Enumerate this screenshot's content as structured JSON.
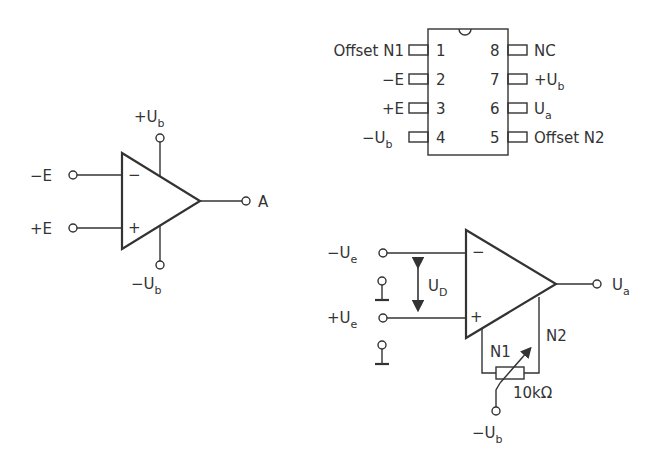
{
  "symbol": {
    "inverting_input": "−E",
    "noninverting_input": "+E",
    "output": "A",
    "supply_pos": "+U",
    "supply_pos_sub": "b",
    "supply_neg": "−U",
    "supply_neg_sub": "b",
    "minus_sign": "−",
    "plus_sign": "+"
  },
  "pinout": {
    "left_pins": [
      {
        "num": "1",
        "label": "Offset N1",
        "sub": ""
      },
      {
        "num": "2",
        "label": "−E",
        "sub": ""
      },
      {
        "num": "3",
        "label": "+E",
        "sub": ""
      },
      {
        "num": "4",
        "label": "−U",
        "sub": "b"
      }
    ],
    "right_pins": [
      {
        "num": "8",
        "label": "NC",
        "sub": ""
      },
      {
        "num": "7",
        "label": "+U",
        "sub": "b"
      },
      {
        "num": "6",
        "label": "U",
        "sub": "a"
      },
      {
        "num": "5",
        "label": "Offset N2",
        "sub": ""
      }
    ]
  },
  "offset_circuit": {
    "inv_input": "−U",
    "inv_input_sub": "e",
    "noninv_input": "+U",
    "noninv_input_sub": "e",
    "diff_voltage": "U",
    "diff_voltage_sub": "D",
    "output": "U",
    "output_sub": "a",
    "n1": "N1",
    "n2": "N2",
    "pot_value": "10kΩ",
    "supply": "−U",
    "supply_sub": "b",
    "minus_sign": "−",
    "plus_sign": "+"
  }
}
